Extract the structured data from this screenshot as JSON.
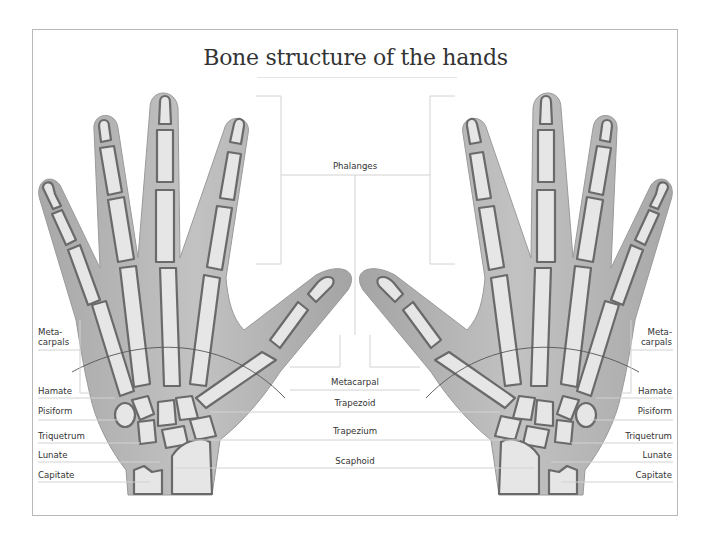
{
  "title": "Bone structure of the hands",
  "colors": {
    "skin": "#b4b4b4",
    "skin_dark": "#9c9c9c",
    "bone_fill": "#e6e6e6",
    "bone_outline": "#6a6a6a",
    "leader_line": "#d2d2d2",
    "frame_border": "#b8b8b8",
    "text": "#333333"
  },
  "labels": {
    "center": {
      "phalanges": "Phalanges",
      "metacarpal": "Metacarpal",
      "trapezoid": "Trapezoid",
      "trapezium": "Trapezium",
      "scaphoid": "Scaphoid"
    },
    "left": {
      "metacarpals_1": "Meta-",
      "metacarpals_2": "carpals",
      "hamate": "Hamate",
      "pisiform": "Pisiform",
      "triquetrum": "Triquetrum",
      "lunate": "Lunate",
      "capitate": "Capitate"
    },
    "right": {
      "metacarpals_1": "Meta-",
      "metacarpals_2": "carpals",
      "hamate": "Hamate",
      "pisiform": "Pisiform",
      "triquetrum": "Triquetrum",
      "lunate": "Lunate",
      "capitate": "Capitate"
    }
  }
}
